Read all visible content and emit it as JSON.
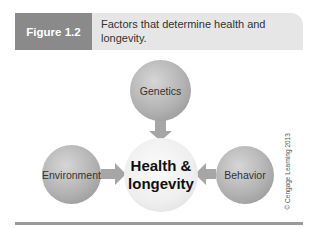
{
  "figure": {
    "label": "Figure 1.2",
    "caption": "Factors that determine health and longevity."
  },
  "diagram": {
    "center": {
      "line1": "Health &",
      "line2": "longevity"
    },
    "nodes": [
      {
        "label": "Genetics",
        "position": "top"
      },
      {
        "label": "Environment",
        "position": "left"
      },
      {
        "label": "Behavior",
        "position": "right"
      }
    ],
    "arrows": [
      "Genetics -> Health & longevity",
      "Environment -> Health & longevity",
      "Behavior -> Health & longevity"
    ]
  },
  "credit": "© Cengage Learning 2013",
  "colors": {
    "label_bg": "#8a8a8a",
    "header_bg": "#e6e6e6",
    "arrow": "#a6a6a6",
    "rule": "#9a9a9a"
  }
}
